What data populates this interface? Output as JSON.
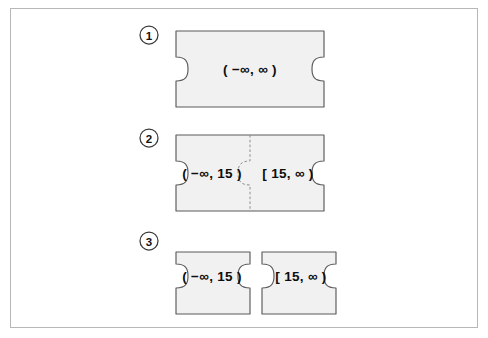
{
  "figure": {
    "background_color": "#ffffff",
    "frame_color": "#b8b8b8",
    "piece_fill": "#f1f1f1",
    "piece_stroke": "#5a5a5a",
    "seam_color": "#8e8e8e"
  },
  "rows": [
    {
      "number": "1",
      "pieces": [
        {
          "label": "( −∞, ∞ )"
        }
      ]
    },
    {
      "number": "2",
      "joined": "true",
      "pieces": [
        {
          "label": "( −∞, 15 )"
        },
        {
          "label": "[ 15, ∞ )"
        }
      ]
    },
    {
      "number": "3",
      "joined": "false",
      "pieces": [
        {
          "label": "( −∞, 15 )"
        },
        {
          "label": "[ 15, ∞ )"
        }
      ]
    }
  ]
}
